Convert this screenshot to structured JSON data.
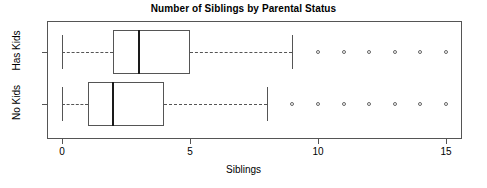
{
  "chart_data": {
    "type": "box",
    "title": "Number of Siblings by Parental Status",
    "xlabel": "Siblings",
    "ylabel": "",
    "orientation": "horizontal",
    "xlim": [
      -0.7,
      15.6
    ],
    "xticks": [
      0,
      5,
      10,
      15
    ],
    "xtick_labels": [
      "0",
      "5",
      "10",
      "15"
    ],
    "grid": false,
    "legend": "none",
    "categories": [
      "No Kids",
      "Has Kids"
    ],
    "series": [
      {
        "name": "Has Kids",
        "row": 2,
        "whisker_low": 0,
        "q1": 2,
        "median": 3,
        "q3": 5,
        "whisker_high": 9,
        "outliers": [
          10,
          11,
          12,
          13,
          14,
          15
        ]
      },
      {
        "name": "No Kids",
        "row": 1,
        "whisker_low": 0,
        "q1": 1,
        "median": 2,
        "q3": 4,
        "whisker_high": 8,
        "outliers": [
          9,
          10,
          11,
          12,
          13,
          14,
          15
        ]
      }
    ]
  },
  "colors": {
    "frame": "#555555",
    "box_border": "#555555",
    "median": "#1a1a1a",
    "outlier": "#666666",
    "background": "#ffffff",
    "text": "#000000"
  },
  "geometry": {
    "plot_left": 47,
    "plot_top": 21,
    "plot_width": 415,
    "plot_height": 118,
    "x_zero_px": 62,
    "px_per_unit": 25.6,
    "row_centers": {
      "has_kids": 52,
      "no_kids": 104
    },
    "box_half_height": 22
  }
}
